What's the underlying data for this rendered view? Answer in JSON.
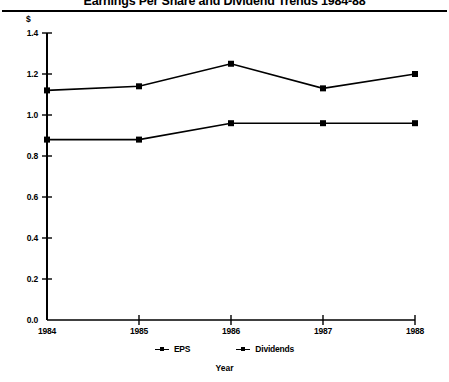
{
  "chart_data": {
    "type": "line",
    "title": "Earnings Per Share and Dividend Trends 1984-88",
    "xlabel": "Year",
    "ylabel": "$",
    "unit_label": "$",
    "categories": [
      "1984",
      "1985",
      "1986",
      "1987",
      "1988"
    ],
    "x": [
      1984,
      1985,
      1986,
      1987,
      1988
    ],
    "series": [
      {
        "name": "EPS",
        "values": [
          1.12,
          1.14,
          1.25,
          1.13,
          1.2
        ],
        "marker": "square",
        "color": "#000000"
      },
      {
        "name": "Dividends",
        "values": [
          0.88,
          0.88,
          0.96,
          0.96,
          0.96
        ],
        "marker": "square",
        "color": "#000000"
      }
    ],
    "ylim": [
      0.0,
      1.4
    ],
    "yticks": [
      "0.0",
      "0.2",
      "0.4",
      "0.6",
      "0.8",
      "1.0",
      "1.2",
      "1.4"
    ],
    "ytick_values": [
      0.0,
      0.2,
      0.4,
      0.6,
      0.8,
      1.0,
      1.2,
      1.4
    ],
    "xticks": [
      "1984",
      "1985",
      "1986",
      "1987",
      "1988"
    ],
    "grid": false,
    "legend_position": "bottom",
    "legend_entries": [
      "EPS",
      "Dividends"
    ],
    "line_color": "#000000",
    "axis_color": "#000000",
    "background": "#ffffff"
  },
  "legend": {
    "entries": [
      {
        "label": "EPS"
      },
      {
        "label": "Dividends"
      }
    ]
  }
}
